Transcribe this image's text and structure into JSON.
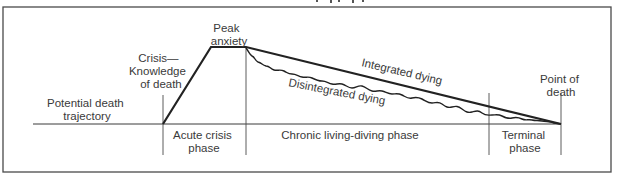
{
  "figure": {
    "top_title_fragment": "…dying, dying… (cut off)",
    "frame_color": "#4a4a4a",
    "line_color": "#222222",
    "text_color": "#3a3a3a"
  },
  "labels": {
    "potential_trajectory": [
      "Potential death",
      "trajectory"
    ],
    "crisis": [
      "Crisis—",
      "Knowledge",
      "of death"
    ],
    "peak": [
      "Peak",
      "anxiety"
    ],
    "integrated": "Integrated dying",
    "disintegrated": "Disintegrated dying",
    "point_of_death": [
      "Point of",
      "death"
    ]
  },
  "phases": [
    {
      "label": [
        "Acute crisis",
        "phase"
      ]
    },
    {
      "label": [
        "Chronic living-diving phase"
      ]
    },
    {
      "label": [
        "Terminal",
        "phase"
      ]
    }
  ],
  "geometry": {
    "baseline_y": 124,
    "baseline_x_start": 33,
    "baseline_x_end": 561,
    "crisis_x": 163,
    "peak_start": [
      211,
      47
    ],
    "peak_end": [
      246,
      47
    ],
    "terminal_x": 489,
    "death_x": 561
  }
}
